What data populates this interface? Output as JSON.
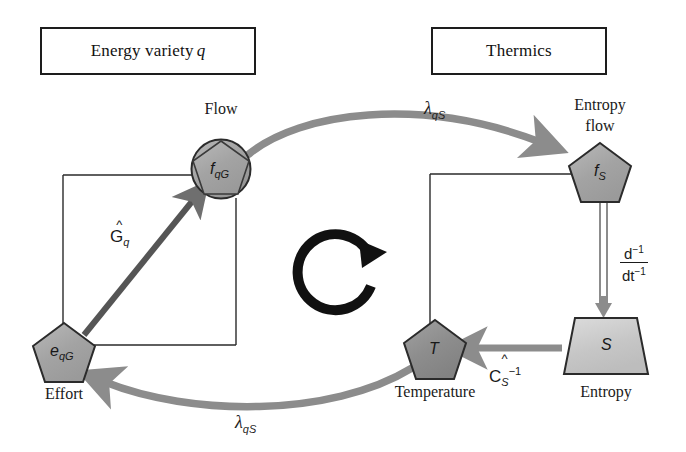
{
  "diagram": {
    "title_left": "Energy variety",
    "title_left_italic": "q",
    "title_right": "Thermics",
    "nodes": [
      {
        "id": "flow",
        "caption": "Flow",
        "symbol": "f",
        "sub": "qG",
        "shape": "pentagon-in-circle",
        "fill": "#a8a8a8"
      },
      {
        "id": "entropy_flow",
        "caption": "Entropy\nflow",
        "symbol": "f",
        "sub": "S",
        "shape": "pentagon",
        "fill": "#a8a8a8"
      },
      {
        "id": "effort",
        "caption": "Effort",
        "symbol": "e",
        "sub": "qG",
        "shape": "pentagon",
        "fill": "#a8a8a8"
      },
      {
        "id": "temperature",
        "caption": "Temperature",
        "symbol": "T",
        "sub": "",
        "shape": "pentagon",
        "fill": "#8d8d8d"
      },
      {
        "id": "entropy",
        "caption": "Entropy",
        "symbol": "S",
        "sub": "",
        "shape": "trapezoid",
        "fill": "#c8c8c8"
      }
    ],
    "captions": {
      "flow": "Flow",
      "entropy_flow_line1": "Entropy",
      "entropy_flow_line2": "flow",
      "effort": "Effort",
      "temperature": "Temperature",
      "entropy": "Entropy"
    },
    "node_symbols": {
      "flow": "f",
      "flow_sub": "qG",
      "entropy_flow": "f",
      "entropy_flow_sub": "S",
      "effort": "e",
      "effort_sub": "qG",
      "temperature": "T",
      "entropy": "S"
    },
    "edge_labels": {
      "lambda_top": "λ",
      "lambda_top_sub": "qS",
      "lambda_bottom": "λ",
      "lambda_bottom_sub": "qS",
      "g_operator_base": "G",
      "g_operator_sub": "q",
      "g_operator_hat": "^",
      "c_operator_base": "C",
      "c_operator_sub": "S",
      "c_operator_sup": "−1",
      "c_operator_hat": "^",
      "derivative_num": "d",
      "derivative_num_sup": "−1",
      "derivative_den": "dt",
      "derivative_den_sup": "−1"
    },
    "cycle_icon": "circular-arrow",
    "colors": {
      "stroke": "#1d1d1d",
      "gray_arrow": "#8c8c8c",
      "node_fill_dark": "#8d8d8d",
      "node_fill_mid": "#a8a8a8",
      "node_fill_light": "#c8c8c8",
      "thin_line": "#2a2a2a",
      "background": "#ffffff"
    }
  }
}
